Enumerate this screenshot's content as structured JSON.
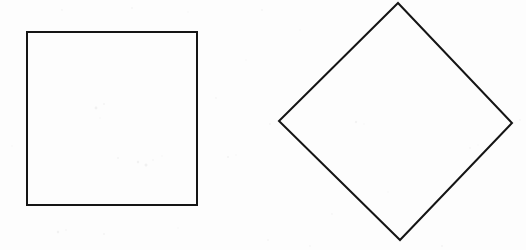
{
  "canvas": {
    "width": 526,
    "height": 250,
    "background_color": "#fdfdfd",
    "description": "Two line-drawn quadrilaterals on a blank off-white scanned page"
  },
  "style": {
    "stroke_color": "#151515",
    "stroke_width": 2,
    "fill": "none"
  },
  "figures": [
    {
      "id": "square",
      "name": "Square",
      "kind": "axis-aligned-square",
      "points": "27,32 197,32 197,205 27,205",
      "vertices": [
        {
          "label": "top-left",
          "x": 27,
          "y": 32
        },
        {
          "label": "top-right",
          "x": 197,
          "y": 32
        },
        {
          "label": "bottom-right",
          "x": 197,
          "y": 205
        },
        {
          "label": "bottom-left",
          "x": 27,
          "y": 205
        }
      ],
      "width": 170,
      "height": 173,
      "rotation_degrees": 0
    },
    {
      "id": "diamond",
      "name": "Diamond",
      "kind": "rotated-square",
      "points": "398,3 512,123 400,240 279,121",
      "vertices": [
        {
          "label": "top",
          "x": 398,
          "y": 3
        },
        {
          "label": "right",
          "x": 512,
          "y": 123
        },
        {
          "label": "bottom",
          "x": 400,
          "y": 240
        },
        {
          "label": "left",
          "x": 279,
          "y": 121
        }
      ],
      "width": 233,
      "height": 237,
      "rotation_degrees": 45
    }
  ],
  "speckles": [
    {
      "x": 96,
      "y": 108,
      "r": 1.4,
      "o": 0.16
    },
    {
      "x": 104,
      "y": 104,
      "r": 1.0,
      "o": 0.13
    },
    {
      "x": 100,
      "y": 118,
      "r": 0.8,
      "o": 0.1
    },
    {
      "x": 138,
      "y": 162,
      "r": 1.2,
      "o": 0.15
    },
    {
      "x": 146,
      "y": 165,
      "r": 1.5,
      "o": 0.17
    },
    {
      "x": 153,
      "y": 160,
      "r": 0.9,
      "o": 0.11
    },
    {
      "x": 118,
      "y": 158,
      "r": 1.0,
      "o": 0.12
    },
    {
      "x": 162,
      "y": 156,
      "r": 0.7,
      "o": 0.09
    },
    {
      "x": 228,
      "y": 157,
      "r": 1.1,
      "o": 0.13
    },
    {
      "x": 236,
      "y": 155,
      "r": 0.8,
      "o": 0.1
    },
    {
      "x": 58,
      "y": 232,
      "r": 1.3,
      "o": 0.14
    },
    {
      "x": 66,
      "y": 230,
      "r": 0.9,
      "o": 0.11
    },
    {
      "x": 104,
      "y": 234,
      "r": 1.0,
      "o": 0.12
    },
    {
      "x": 178,
      "y": 228,
      "r": 0.8,
      "o": 0.1
    },
    {
      "x": 268,
      "y": 240,
      "r": 1.0,
      "o": 0.11
    },
    {
      "x": 310,
      "y": 246,
      "r": 0.9,
      "o": 0.1
    },
    {
      "x": 442,
      "y": 246,
      "r": 1.1,
      "o": 0.12
    },
    {
      "x": 62,
      "y": 10,
      "r": 0.9,
      "o": 0.1
    },
    {
      "x": 132,
      "y": 8,
      "r": 1.0,
      "o": 0.11
    },
    {
      "x": 188,
      "y": 12,
      "r": 0.8,
      "o": 0.09
    },
    {
      "x": 262,
      "y": 10,
      "r": 1.0,
      "o": 0.11
    },
    {
      "x": 300,
      "y": 30,
      "r": 0.8,
      "o": 0.09
    },
    {
      "x": 270,
      "y": 124,
      "r": 1.0,
      "o": 0.11
    },
    {
      "x": 356,
      "y": 122,
      "r": 1.2,
      "o": 0.13
    },
    {
      "x": 364,
      "y": 124,
      "r": 0.8,
      "o": 0.1
    },
    {
      "x": 470,
      "y": 148,
      "r": 0.9,
      "o": 0.1
    },
    {
      "x": 478,
      "y": 145,
      "r": 0.7,
      "o": 0.08
    },
    {
      "x": 520,
      "y": 120,
      "r": 0.9,
      "o": 0.1
    },
    {
      "x": 12,
      "y": 146,
      "r": 0.8,
      "o": 0.09
    },
    {
      "x": 216,
      "y": 98,
      "r": 0.9,
      "o": 0.1
    },
    {
      "x": 246,
      "y": 60,
      "r": 0.8,
      "o": 0.09
    },
    {
      "x": 388,
      "y": 192,
      "r": 0.8,
      "o": 0.09
    },
    {
      "x": 332,
      "y": 214,
      "r": 0.9,
      "o": 0.1
    }
  ]
}
